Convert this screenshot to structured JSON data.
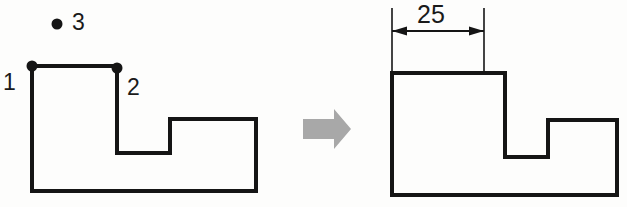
{
  "canvas": {
    "width": 627,
    "height": 207,
    "background": "#fdfdfc",
    "line_color": "#151515",
    "arrow_fill": "#a8a8a8"
  },
  "before": {
    "name": "before-shape",
    "description": "L-shaped profile with notch, before dimensioning",
    "outline_points": "32,66 117,66 117,153 170,153 170,119 256,119 256,191 32,191",
    "pick_points": [
      {
        "id": "pick-1",
        "label": "1",
        "marker": false,
        "x": 32,
        "y": 66,
        "label_x": 3,
        "label_y": 71
      },
      {
        "id": "pick-2",
        "label": "2",
        "marker": true,
        "x": 117,
        "y": 68,
        "label_x": 127,
        "label_y": 76
      },
      {
        "id": "pick-3",
        "label": "3",
        "marker": true,
        "x": 57,
        "y": 24,
        "label_x": 72,
        "label_y": 11
      }
    ],
    "vertex_dot_1": {
      "x": 32,
      "y": 66
    },
    "vertex_dot_2": {
      "x": 117,
      "y": 68
    },
    "free_dot_3": {
      "x": 57,
      "y": 24
    }
  },
  "transition": {
    "name": "transition-arrow",
    "icon": "right-arrow-icon",
    "color": "#a8a8a8"
  },
  "after": {
    "name": "after-shape",
    "description": "Same L-shaped profile with horizontal dimension applied",
    "outline_points": "392,73 505,73 505,157 548,157 548,120 617,120 617,195 392,195",
    "dimension": {
      "id": "dimension-25",
      "value": "25",
      "unit": "",
      "orientation": "horizontal",
      "line_y": 31,
      "from_x": 392,
      "to_x": 484,
      "ext_line_top": 8,
      "ext_line_bottom": 74,
      "text_x": 417,
      "text_y": 2
    }
  }
}
